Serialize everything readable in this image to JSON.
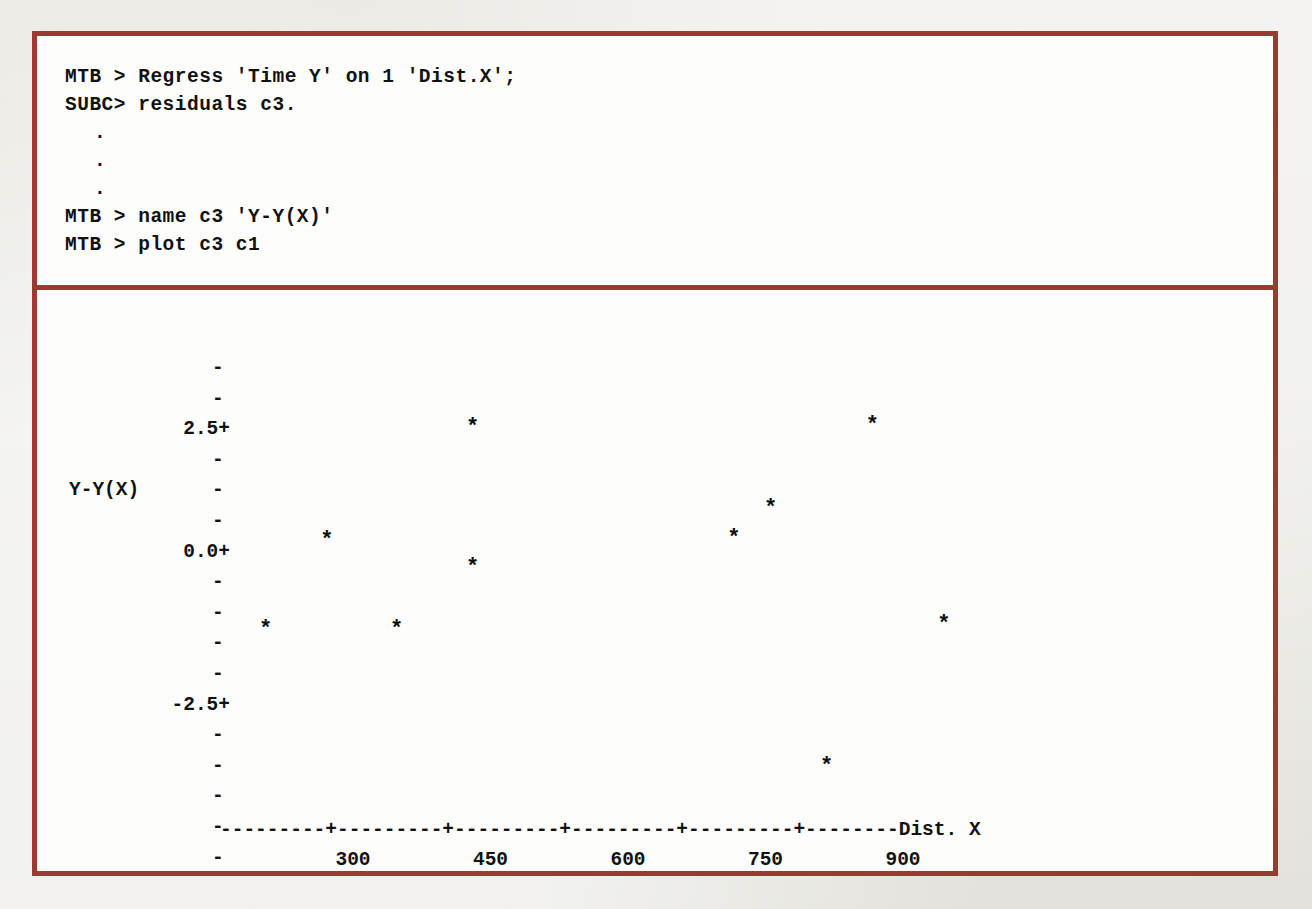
{
  "figure": {
    "border_color": "#9c3a32",
    "paper_color": "#fdfdfb",
    "page_color": "#e9e8e3"
  },
  "console": {
    "lines": [
      "MTB > Regress 'Time Y' on 1 'Dist.X';",
      "SUBC> residuals c3."
    ],
    "ellipsis": [
      ".",
      ".",
      "."
    ],
    "lines2": [
      "MTB > name c3 'Y-Y(X)'",
      "MTB > plot c3 c1"
    ]
  },
  "chart_data": {
    "type": "scatter",
    "title": "",
    "xlabel": "Dist. X",
    "ylabel": "Y-Y(X)",
    "marker": "*",
    "grid": false,
    "legend": null,
    "xlim": [
      150,
      1000
    ],
    "ylim": [
      -4.4,
      3.6
    ],
    "xticks": [
      "300",
      "450",
      "600",
      "750",
      "900"
    ],
    "xtick_values": [
      300,
      450,
      600,
      750,
      900
    ],
    "yticks": [
      "2.5+",
      "0.0+",
      "-2.5+"
    ],
    "ytick_values": [
      2.5,
      0.0,
      -2.5
    ],
    "ytick_minor_glyph": "-",
    "axis_rule": "---------+---------+---------+---------+---------+--------",
    "points": [
      {
        "x": 205,
        "y": -1.6
      },
      {
        "x": 272,
        "y": 0.2
      },
      {
        "x": 348,
        "y": -1.6
      },
      {
        "x": 431,
        "y": -0.35
      },
      {
        "x": 431,
        "y": 2.5
      },
      {
        "x": 716,
        "y": 0.25
      },
      {
        "x": 756,
        "y": 0.85
      },
      {
        "x": 817,
        "y": -4.4
      },
      {
        "x": 867,
        "y": 2.55
      },
      {
        "x": 945,
        "y": -1.5
      }
    ]
  },
  "footer": {
    "ghost_text": ""
  }
}
